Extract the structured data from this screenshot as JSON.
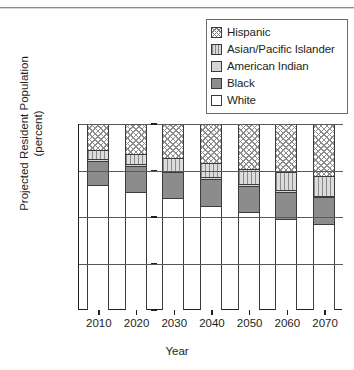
{
  "chart_data": {
    "type": "bar",
    "stacked": true,
    "title": "",
    "xlabel": "Year",
    "ylabel": "Projected Resident Population\n(percent)",
    "categories": [
      "2010",
      "2020",
      "2030",
      "2040",
      "2050",
      "2060",
      "2070"
    ],
    "ylim": [
      0,
      100
    ],
    "yticks": [
      0,
      25,
      50,
      75,
      100
    ],
    "ytick_labels": [
      "0",
      "25",
      "50",
      "75",
      "100"
    ],
    "grid": true,
    "legend_position": "top-right",
    "series": [
      {
        "name": "White",
        "pattern": "solid-white",
        "color": "#ffffff",
        "values": [
          67,
          63.5,
          60,
          56,
          52.5,
          49,
          46.5
        ]
      },
      {
        "name": "Black",
        "pattern": "solid-gray",
        "color": "#8c8c8c",
        "values": [
          13,
          14,
          14,
          14.5,
          14,
          14.5,
          14
        ]
      },
      {
        "name": "American Indian",
        "pattern": "solid-lightgray",
        "color": "#d4d4d4",
        "values": [
          1,
          1,
          1,
          1,
          1,
          1,
          1
        ]
      },
      {
        "name": "Asian/Pacific Islander",
        "pattern": "vertical-lines",
        "color": "#dcdcdc",
        "values": [
          5,
          5.5,
          6.5,
          7.5,
          8.5,
          9.5,
          10.5
        ]
      },
      {
        "name": "Hispanic",
        "pattern": "diagonal-hatch",
        "color": "#ffffff",
        "values": [
          14,
          16,
          18.5,
          21,
          24,
          26,
          28
        ]
      }
    ]
  },
  "legend": {
    "items": [
      {
        "label": "Hispanic",
        "swatch": "diagonal-hatch-swatch"
      },
      {
        "label": "Asian/Pacific Islander",
        "swatch": "vertical-lines-swatch"
      },
      {
        "label": "American Indian",
        "swatch": "light-gray-swatch"
      },
      {
        "label": "Black",
        "swatch": "medium-gray-swatch"
      },
      {
        "label": "White",
        "swatch": "white-swatch"
      }
    ]
  },
  "axes": {
    "y_title": "Projected Resident Population\n(percent)",
    "x_title": "Year",
    "y_tick_labels": [
      "100",
      "75",
      "50",
      "25",
      "0"
    ],
    "x_tick_labels": [
      "2010",
      "2020",
      "2030",
      "2040",
      "2050",
      "2060",
      "2070"
    ]
  }
}
